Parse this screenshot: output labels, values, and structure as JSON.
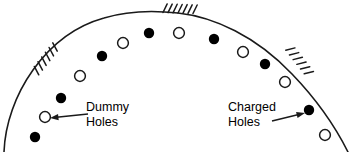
{
  "figure": {
    "stroke_color": "#1a1a1a",
    "fill_color": "#000000",
    "background_color": "#ffffff"
  },
  "annotations": [
    {
      "id": "dummy",
      "line1": "Dummy",
      "line2": "Holes",
      "text_x": 86,
      "text_y": 111,
      "arrow_from_x": 88,
      "arrow_from_y": 114,
      "arrow_to_x": 50,
      "arrow_to_y": 118,
      "points_to": "open-circle"
    },
    {
      "id": "charged",
      "line1": "Charged",
      "line2": "Holes",
      "text_x": 228,
      "text_y": 111,
      "arrow_from_x": 272,
      "arrow_from_y": 121,
      "arrow_to_x": 305,
      "arrow_to_y": 113,
      "points_to": "filled-circle"
    }
  ],
  "arc": {
    "description": "dome-shaped outer boundary",
    "path": "M 4 152 C 6 96 46 34 104 18 C 130 10 160 11 178 13 C 214 17 256 36 292 74 C 318 101 336 128 348 152",
    "stroke_width": 1.6
  },
  "hatch_groups": [
    {
      "id": "hatch-left",
      "count": 6,
      "base_x": 48,
      "base_y": 63,
      "angle": -52
    },
    {
      "id": "hatch-top",
      "count": 7,
      "base_x": 178,
      "base_y": 13,
      "angle": 2
    },
    {
      "id": "hatch-right",
      "count": 6,
      "base_x": 295,
      "base_y": 62,
      "angle": 52
    }
  ],
  "holes": [
    {
      "id": "hole-1",
      "type": "filled",
      "cx": 35,
      "cy": 137,
      "r": 5.2
    },
    {
      "id": "hole-2",
      "type": "open",
      "cx": 45,
      "cy": 117,
      "r": 5.4
    },
    {
      "id": "hole-3",
      "type": "filled",
      "cx": 61,
      "cy": 98,
      "r": 5.2
    },
    {
      "id": "hole-4",
      "type": "open",
      "cx": 80,
      "cy": 76,
      "r": 5.4
    },
    {
      "id": "hole-5",
      "type": "filled",
      "cx": 102,
      "cy": 56,
      "r": 5.2
    },
    {
      "id": "hole-6",
      "type": "open",
      "cx": 123,
      "cy": 43,
      "r": 5.4
    },
    {
      "id": "hole-7",
      "type": "filled",
      "cx": 149,
      "cy": 33,
      "r": 5.2
    },
    {
      "id": "hole-8",
      "type": "open",
      "cx": 179,
      "cy": 33,
      "r": 5.4
    },
    {
      "id": "hole-9",
      "type": "filled",
      "cx": 214,
      "cy": 39,
      "r": 5.2
    },
    {
      "id": "hole-10",
      "type": "open",
      "cx": 243,
      "cy": 52,
      "r": 5.4
    },
    {
      "id": "hole-11",
      "type": "filled",
      "cx": 265,
      "cy": 64,
      "r": 5.2
    },
    {
      "id": "hole-12",
      "type": "open",
      "cx": 285,
      "cy": 82,
      "r": 5.4
    },
    {
      "id": "hole-13",
      "type": "filled",
      "cx": 309,
      "cy": 110,
      "r": 5.2
    },
    {
      "id": "hole-14",
      "type": "open",
      "cx": 325,
      "cy": 135,
      "r": 5.4
    }
  ]
}
